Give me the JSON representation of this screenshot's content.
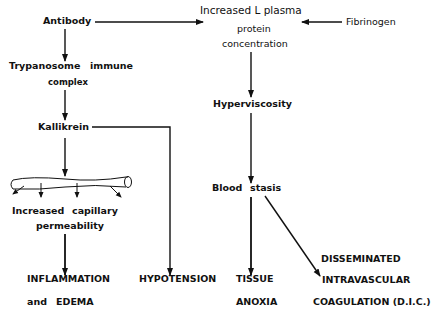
{
  "diagram": {
    "nodes": {
      "antibody": "Antibody",
      "plasma_line1": "Increased L plasma",
      "plasma_line2": "protein",
      "plasma_line3": "concentration",
      "fibrinogen": "Fibrinogen",
      "trypanosome_a": "Trypanosome",
      "trypanosome_b": "immune",
      "trypanosome_c": "complex",
      "kallikrein": "Kallikrein",
      "hyperviscosity": "Hyperviscosity",
      "blood_a": "Blood",
      "blood_b": "stasis",
      "permeability_a": "Increased",
      "permeability_b": "capillary",
      "permeability_c": "permeability",
      "inflammation_a": "INFLAMMATION",
      "inflammation_b": "and",
      "inflammation_c": "EDEMA",
      "hypotension": "HYPOTENSION",
      "tissue_a": "TISSUE",
      "tissue_b": "ANOXIA",
      "dic_a": "DISSEMINATED",
      "dic_b": "INTRAVASCULAR",
      "dic_c": "COAGULATION (D.I.C.)"
    },
    "edges": [
      [
        "Antibody",
        "Increased plasma protein concentration"
      ],
      [
        "Fibrinogen",
        "Increased plasma protein concentration"
      ],
      [
        "Antibody",
        "Trypanosome immune complex"
      ],
      [
        "Trypanosome immune complex",
        "Kallikrein"
      ],
      [
        "Kallikrein",
        "Increased capillary permeability"
      ],
      [
        "Kallikrein",
        "HYPOTENSION"
      ],
      [
        "Increased capillary permeability",
        "INFLAMMATION and EDEMA"
      ],
      [
        "Increased plasma protein concentration",
        "Hyperviscosity"
      ],
      [
        "Hyperviscosity",
        "Blood stasis"
      ],
      [
        "Blood stasis",
        "TISSUE ANOXIA"
      ],
      [
        "Blood stasis",
        "DISSEMINATED INTRAVASCULAR COAGULATION (D.I.C.)"
      ]
    ]
  }
}
